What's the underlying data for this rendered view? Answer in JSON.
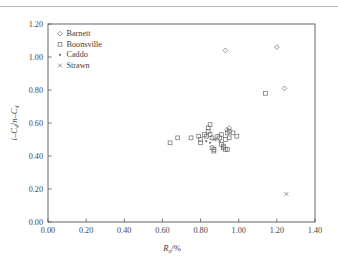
{
  "figure": {
    "name": "isobutane-to-normal-butane-ratio-vs-vitrinite-reflectance",
    "background": "#ffffff",
    "rule_color": "#b9b9b9"
  },
  "chart_data": {
    "type": "scatter",
    "title": "",
    "subtitle": "",
    "xlabel": "Rₒ/%",
    "xlabel_parts": {
      "symbol": "R",
      "subscript": "o",
      "unit": "/%"
    },
    "ylabel": "i–C₄/n–C₄",
    "ylabel_parts": {
      "first": "i–C",
      "first_sub": "4",
      "sep": "/",
      "second": "n–C",
      "second_sub": "4"
    },
    "xlim": [
      0.0,
      1.4
    ],
    "ylim": [
      0.0,
      1.2
    ],
    "xticks": [
      "0.00",
      "0.20",
      "0.40",
      "0.60",
      "0.80",
      "1.00",
      "1.20",
      "1.40"
    ],
    "xtick_values": [
      0.0,
      0.2,
      0.4,
      0.6,
      0.8,
      1.0,
      1.2,
      1.4
    ],
    "yticks": [
      "0.00",
      "0.20",
      "0.40",
      "0.60",
      "0.80",
      "1.00",
      "1.20"
    ],
    "ytick_values": [
      0.0,
      0.2,
      0.4,
      0.6,
      0.8,
      1.0,
      1.2
    ],
    "grid": false,
    "legend_position": "top-left-inside",
    "marker_color": "#6d6e72",
    "series": [
      {
        "name": "Barnett",
        "marker": "diamond",
        "points": [
          [
            0.93,
            1.04
          ],
          [
            1.2,
            1.06
          ],
          [
            1.24,
            0.81
          ],
          [
            0.95,
            0.57
          ],
          [
            0.94,
            0.56
          ]
        ]
      },
      {
        "name": "Boonsville",
        "marker": "square",
        "points": [
          [
            0.64,
            0.48
          ],
          [
            0.68,
            0.51
          ],
          [
            0.75,
            0.51
          ],
          [
            0.79,
            0.52
          ],
          [
            0.8,
            0.5
          ],
          [
            0.8,
            0.48
          ],
          [
            0.82,
            0.53
          ],
          [
            0.83,
            0.52
          ],
          [
            0.84,
            0.55
          ],
          [
            0.84,
            0.57
          ],
          [
            0.85,
            0.59
          ],
          [
            0.85,
            0.53
          ],
          [
            0.86,
            0.51
          ],
          [
            0.86,
            0.45
          ],
          [
            0.87,
            0.43
          ],
          [
            0.87,
            0.44
          ],
          [
            0.89,
            0.52
          ],
          [
            0.9,
            0.51
          ],
          [
            0.91,
            0.53
          ],
          [
            0.91,
            0.47
          ],
          [
            0.92,
            0.46
          ],
          [
            0.92,
            0.45
          ],
          [
            0.93,
            0.5
          ],
          [
            0.93,
            0.44
          ],
          [
            0.94,
            0.44
          ],
          [
            0.94,
            0.54
          ],
          [
            0.95,
            0.55
          ],
          [
            0.95,
            0.51
          ],
          [
            0.97,
            0.54
          ],
          [
            0.99,
            0.52
          ],
          [
            1.14,
            0.78
          ]
        ]
      },
      {
        "name": "Caddo",
        "marker": "dot",
        "points": [
          [
            0.83,
            0.49
          ],
          [
            0.85,
            0.48
          ],
          [
            0.88,
            0.5
          ],
          [
            0.9,
            0.49
          ]
        ]
      },
      {
        "name": "Strawn",
        "marker": "cross",
        "points": [
          [
            0.87,
            0.5
          ],
          [
            1.25,
            0.17
          ]
        ]
      }
    ]
  },
  "legend": {
    "entries": [
      {
        "label": "Barnett",
        "marker": "diamond"
      },
      {
        "label": "Boonsville",
        "marker": "square"
      },
      {
        "label": "Caddo",
        "marker": "dot"
      },
      {
        "label": "Strawn",
        "marker": "cross"
      }
    ]
  }
}
